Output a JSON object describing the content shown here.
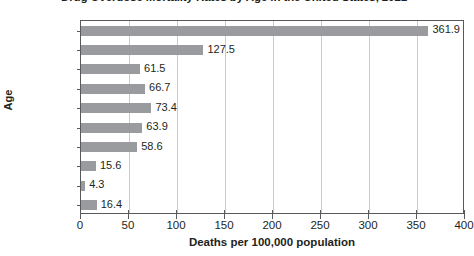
{
  "chart_data": {
    "type": "bar",
    "orientation": "horizontal",
    "title": "Drug Overdose Mortality Rates by Age in the United States, 2021",
    "xlabel": "Deaths per 100,000 population",
    "ylabel": "Age",
    "xlim": [
      0,
      400
    ],
    "xticks": [
      0,
      50,
      100,
      150,
      200,
      250,
      300,
      350,
      400
    ],
    "grid": true,
    "legend": false,
    "bar_color": "#999b9e",
    "categories": [
      "85 and over",
      "75–84",
      "65–74",
      "55–64",
      "45–54",
      "25–44",
      "18–24",
      "12–17",
      "5–11",
      "0–4"
    ],
    "values": [
      361.9,
      127.5,
      61.5,
      66.7,
      73.4,
      63.9,
      58.6,
      15.6,
      4.3,
      16.4
    ],
    "value_labels": [
      "361.9",
      "127.5",
      "61.5",
      "66.7",
      "73.4",
      "63.9",
      "58.6",
      "15.6",
      "4.3",
      "16.4"
    ]
  }
}
